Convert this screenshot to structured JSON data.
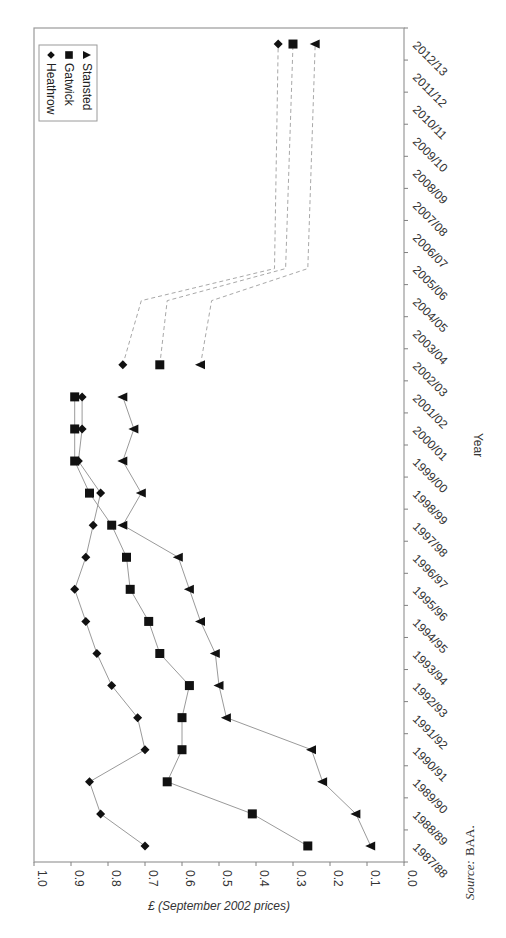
{
  "chart_data": {
    "type": "line",
    "orientation": "rotated-90-clockwise",
    "title": "",
    "xlabel": "Year",
    "ylabel": "£ (September 2002 prices)",
    "ylim": [
      0.0,
      1.0
    ],
    "yticks": [
      "1.0",
      "0.9",
      "0.8",
      "0.7",
      "0.6",
      "0.5",
      "0.4",
      "0.3",
      "0.2",
      "0.1",
      "0.0"
    ],
    "categories": [
      "1987/88",
      "1988/89",
      "1989/90",
      "1990/91",
      "1991/92",
      "1992/93",
      "1993/94",
      "1994/95",
      "1995/96",
      "1996/97",
      "1997/98",
      "1998/99",
      "1999/00",
      "2000/01",
      "2001/02",
      "2002/03",
      "2003/04",
      "2004/05",
      "2005/06",
      "2006/07",
      "2007/08",
      "2008/09",
      "2009/10",
      "2010/11",
      "2011/12",
      "2012/13"
    ],
    "legend_position": "top-left (rotated)",
    "grid": false,
    "series": [
      {
        "name": "Heathrow",
        "marker": "diamond",
        "values": [
          0.7,
          0.82,
          0.85,
          0.7,
          0.72,
          0.79,
          0.83,
          0.86,
          0.89,
          0.86,
          0.84,
          0.82,
          0.88,
          0.87,
          0.87,
          0.76,
          null,
          null,
          null,
          null,
          null,
          null,
          null,
          null,
          null,
          0.34
        ],
        "projection": {
          "points": [
            [
              "2002/03",
              0.76
            ],
            [
              "2004/05",
              0.71
            ],
            [
              "2005/06",
              0.35
            ],
            [
              "2012/13",
              0.34
            ]
          ],
          "style": "dashed"
        }
      },
      {
        "name": "Gatwick",
        "marker": "square",
        "values": [
          0.26,
          0.41,
          0.64,
          0.6,
          0.6,
          0.58,
          0.66,
          0.69,
          0.74,
          0.75,
          0.79,
          0.85,
          0.89,
          0.89,
          0.89,
          0.66,
          null,
          null,
          null,
          null,
          null,
          null,
          null,
          null,
          null,
          0.3
        ],
        "projection": {
          "points": [
            [
              "2002/03",
              0.66
            ],
            [
              "2004/05",
              0.64
            ],
            [
              "2005/06",
              0.32
            ],
            [
              "2012/13",
              0.3
            ]
          ],
          "style": "dashed"
        }
      },
      {
        "name": "Stansted",
        "marker": "triangle",
        "values": [
          0.09,
          0.13,
          0.22,
          0.25,
          0.48,
          0.5,
          0.51,
          0.55,
          0.58,
          0.61,
          0.76,
          0.71,
          0.76,
          0.73,
          0.76,
          0.55,
          null,
          null,
          null,
          null,
          null,
          null,
          null,
          null,
          null,
          0.24
        ],
        "projection": {
          "points": [
            [
              "2002/03",
              0.55
            ],
            [
              "2004/05",
              0.52
            ],
            [
              "2005/06",
              0.26
            ],
            [
              "2012/13",
              0.24
            ]
          ],
          "style": "dashed"
        }
      }
    ],
    "source": "Source: BAA."
  },
  "legend": {
    "items": [
      {
        "label": "Heathrow",
        "marker": "diamond"
      },
      {
        "label": "Gatwick",
        "marker": "square"
      },
      {
        "label": "Stansted",
        "marker": "triangle"
      }
    ]
  },
  "labels": {
    "xlabel": "Year",
    "ylabel": "£ (September 2002 prices)",
    "source_italic": "Source:",
    "source_rest": "BAA."
  },
  "colors": {
    "marker": "#111111",
    "line": "#9a9a9a",
    "dashed": "#a8a8a8",
    "axis": "#808080",
    "border": "#9a9a9a"
  }
}
